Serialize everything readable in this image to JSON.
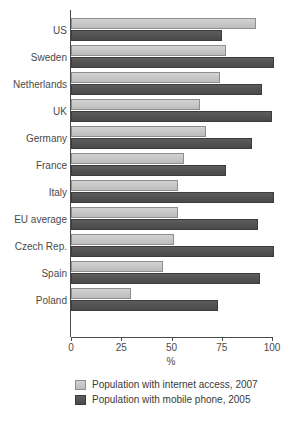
{
  "chart_data": {
    "type": "bar",
    "orientation": "horizontal",
    "title": "",
    "xlabel": "%",
    "ylabel": "",
    "xlim": [
      0,
      100
    ],
    "xticks": [
      0,
      25,
      50,
      75,
      100
    ],
    "xtick_labels": [
      "0",
      "25",
      "50",
      "75",
      "100"
    ],
    "grid": false,
    "legend_position": "bottom",
    "categories": [
      "US",
      "Sweden",
      "Netherlands",
      "UK",
      "Germany",
      "France",
      "Italy",
      "EU average",
      "Czech Rep.",
      "Spain",
      "Poland"
    ],
    "series": [
      {
        "name": "Population with internet access, 2007",
        "color": "#c6c6c6",
        "values": [
          92,
          77,
          74,
          64,
          67,
          56,
          53,
          53,
          51,
          46,
          30
        ]
      },
      {
        "name": "Population with mobile phone, 2005",
        "color": "#4f4f4f",
        "values": [
          75,
          101,
          95,
          100,
          90,
          77,
          101,
          93,
          101,
          94,
          73
        ]
      }
    ]
  },
  "legend": {
    "items": [
      {
        "label": "Population with internet access, 2007",
        "swatch": "light"
      },
      {
        "label": "Population with mobile phone, 2005",
        "swatch": "dark"
      }
    ]
  },
  "axis": {
    "x_title": "%"
  }
}
